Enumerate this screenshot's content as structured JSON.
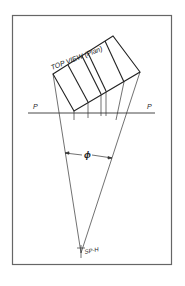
{
  "figure": {
    "view_label": "TOP VIEW (Plan)",
    "picture_plane_left": "P",
    "picture_plane_right": "P",
    "angle_label": "ϕ",
    "station_point_label": "SP-H"
  }
}
